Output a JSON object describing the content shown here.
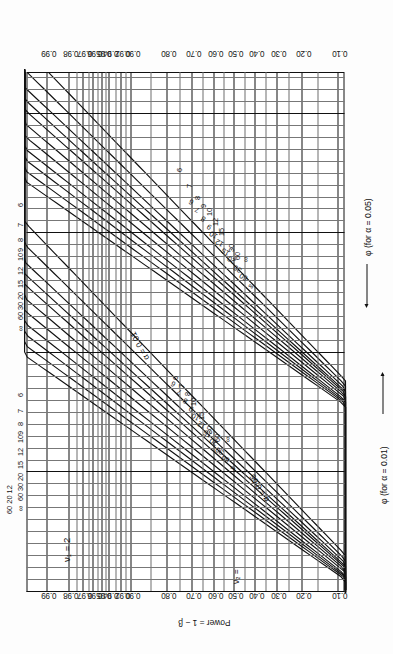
{
  "figure": {
    "kind": "power-function-chart",
    "title_symbol": "v1 = 2",
    "nu1_label": "ν₁ = 2",
    "nu2_label": "ν₂ =",
    "power_axis_title": "Power = 1 − β",
    "phi_axis_05": "φ (for α = 0.05)",
    "phi_axis_01": "φ (for α = 0.01)",
    "alpha_annot_01": "α = 0.01",
    "alpha_annot_05": "α = 0.05",
    "line_color": "#111111",
    "grid_color": "#3a3a3a",
    "page_background": "#fdfdfd"
  },
  "chart_data": {
    "type": "line",
    "xlabel": "φ (for α = 0.05)",
    "xlabel2": "φ (for α = 0.01)",
    "ylabel": "Power = 1 − β",
    "grid": true,
    "legend_position": "inline-curve-labels",
    "y_ticks": [
      "0.99",
      "0.98",
      "0.97",
      "0.96",
      "0.95",
      "0.94",
      "0.92",
      "0.90",
      "0.80",
      "0.70",
      "0.60",
      "0.50",
      "0.40",
      "0.30",
      "0.20",
      "0.10"
    ],
    "y_tick_values": [
      0.99,
      0.98,
      0.97,
      0.96,
      0.95,
      0.94,
      0.92,
      0.9,
      0.8,
      0.7,
      0.6,
      0.5,
      0.4,
      0.3,
      0.2,
      0.1
    ],
    "ylim": [
      0.1,
      0.99
    ],
    "x_ticks_alpha05": [
      "1",
      "2",
      "3",
      "4",
      "5"
    ],
    "x_ticks_alpha01": [
      "2",
      "3"
    ],
    "xlim_alpha05": [
      1,
      5
    ],
    "xlim_alpha01": [
      2,
      3.6
    ],
    "curve_parameter": "ν₂ (denominator degrees of freedom)",
    "curve_labels": [
      "6",
      "7",
      "8",
      "9",
      "10",
      "12",
      "15",
      "20",
      "30",
      "60",
      "∞"
    ],
    "series_alpha05": [
      {
        "name": "6",
        "alpha": 0.05
      },
      {
        "name": "7",
        "alpha": 0.05
      },
      {
        "name": "8",
        "alpha": 0.05
      },
      {
        "name": "9",
        "alpha": 0.05
      },
      {
        "name": "10",
        "alpha": 0.05
      },
      {
        "name": "12",
        "alpha": 0.05
      },
      {
        "name": "15",
        "alpha": 0.05
      },
      {
        "name": "20",
        "alpha": 0.05
      },
      {
        "name": "30",
        "alpha": 0.05
      },
      {
        "name": "60",
        "alpha": 0.05
      },
      {
        "name": "∞",
        "alpha": 0.05
      }
    ],
    "series_alpha01": [
      {
        "name": "6",
        "alpha": 0.01
      },
      {
        "name": "7",
        "alpha": 0.01
      },
      {
        "name": "8",
        "alpha": 0.01
      },
      {
        "name": "9",
        "alpha": 0.01
      },
      {
        "name": "10",
        "alpha": 0.01
      },
      {
        "name": "12",
        "alpha": 0.01
      },
      {
        "name": "15",
        "alpha": 0.01
      },
      {
        "name": "20",
        "alpha": 0.01
      },
      {
        "name": "30",
        "alpha": 0.01
      },
      {
        "name": "60",
        "alpha": 0.01
      },
      {
        "name": "∞",
        "alpha": 0.01
      }
    ],
    "curve_label_groups": {
      "left_top": [
        "6",
        "7",
        "8",
        "9",
        "10",
        "12",
        "15",
        "20",
        "30",
        "60",
        "∞"
      ],
      "left_bottom": [
        "6",
        "7",
        "8",
        "9",
        "10",
        "12",
        "15",
        "20",
        "30",
        "60",
        "∞"
      ],
      "mid_top": [
        "6",
        "7",
        "8",
        "9",
        "10",
        "12",
        "15",
        "20",
        "30",
        "60",
        "∞"
      ],
      "mid_bottom": [
        "6",
        "7",
        "8",
        "9",
        "10",
        "12",
        "15",
        "20",
        "30",
        "60",
        "∞"
      ]
    }
  },
  "labels": {
    "top_nu2_row1": "60  20  12",
    "top_nu2_row2": "30  15  10 9 8",
    "top_nu2_inf": "∞",
    "stack_a": "∞ 60 30 20",
    "stack_b": "15",
    "stack_c": "12",
    "stack_d": "10",
    "stack_e": "9",
    "stack_f": "8",
    "stack_g": "7",
    "stack_h": "6"
  }
}
